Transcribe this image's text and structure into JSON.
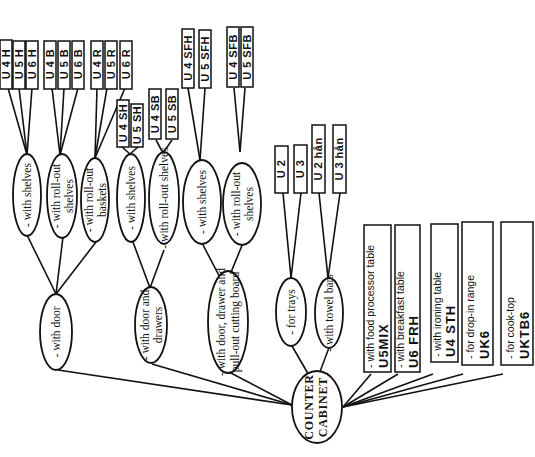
{
  "root": {
    "line1": "COUNTER",
    "line2": "CABINET"
  },
  "branches": {
    "with_door": {
      "label": "- with door",
      "children": [
        {
          "l1": "- with shelves",
          "l2": "",
          "codes": [
            "U 4 H",
            "U 5 H",
            "U 6 H"
          ]
        },
        {
          "l1": "- with roll-out",
          "l2": "shelves",
          "codes": [
            "U 4 B",
            "U 5 B",
            "U 6 B"
          ]
        },
        {
          "l1": "- with roll-out",
          "l2": "baskets",
          "codes": [
            "U 4 R",
            "U 5 R",
            "U 6 R"
          ]
        }
      ]
    },
    "with_door_drawers": {
      "l1": "- with door and",
      "l2": "drawers",
      "children": [
        {
          "l1": "- with shelves",
          "codes": [
            "U 4 SH",
            "U 5 SH"
          ]
        },
        {
          "l1": "- with roll-out shelves",
          "codes": [
            "U 4 SB",
            "U 5 SB"
          ]
        }
      ]
    },
    "with_door_drawer_board": {
      "l1": "- with door, drawer and",
      "l2": "pull-out cutting board",
      "children": [
        {
          "l1": "- with shelves",
          "l2": "",
          "codes": [
            "U 4 SFH",
            "U 5 SFH"
          ]
        },
        {
          "l1": "- with roll-out",
          "l2": "shelves",
          "codes": [
            "U 4 SFB",
            "U 5 SFB"
          ]
        }
      ]
    },
    "for_trays": {
      "label": "- for trays",
      "codes": [
        "U 2",
        "U 3"
      ]
    },
    "with_towel_bars": {
      "label": "- with towel bars",
      "codes": [
        "U 2 hån",
        "U 3 hån"
      ]
    }
  },
  "specials": [
    {
      "desc": "- with food processor table",
      "code": "U5MIX"
    },
    {
      "desc": "- with breakfast table",
      "code": "U6  FRH"
    },
    {
      "desc": "- with ironing table",
      "code": "U4  STH"
    },
    {
      "desc": "- for drop-in range",
      "code": "UK6"
    },
    {
      "desc": "- for cook-top",
      "code": "UKTB6"
    }
  ]
}
